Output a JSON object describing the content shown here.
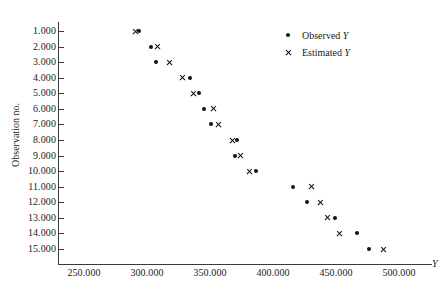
{
  "chart_data": {
    "type": "scatter",
    "title": "",
    "xlabel": "Y",
    "ylabel": "Observation no.",
    "xlim": [
      235,
      515
    ],
    "ylim": [
      0.3,
      15.7
    ],
    "grid": false,
    "x_ticks": [
      "250.000",
      "300.000",
      "350.000",
      "400.000",
      "450.000",
      "500.000"
    ],
    "x_tick_values": [
      250,
      300,
      350,
      400,
      450,
      500
    ],
    "y_ticks": [
      "1.000",
      "2.000",
      "3.000",
      "4.000",
      "5.000",
      "6.000",
      "7.000",
      "8.000",
      "9.000",
      "10.000",
      "11.000",
      "12.000",
      "13.000",
      "14.000",
      "15.000"
    ],
    "y_tick_values": [
      1,
      2,
      3,
      4,
      5,
      6,
      7,
      8,
      9,
      10,
      11,
      12,
      13,
      14,
      15
    ],
    "legend_position": "top-right",
    "series": [
      {
        "name": "Observed Y",
        "marker": "dot",
        "color": "#111111",
        "points": [
          {
            "observation": 1,
            "value": 294.0
          },
          {
            "observation": 2,
            "value": 303.5
          },
          {
            "observation": 3,
            "value": 307.5
          },
          {
            "observation": 4,
            "value": 334.0
          },
          {
            "observation": 5,
            "value": 341.5
          },
          {
            "observation": 6,
            "value": 345.5
          },
          {
            "observation": 7,
            "value": 351.0
          },
          {
            "observation": 8,
            "value": 371.5
          },
          {
            "observation": 9,
            "value": 369.5
          },
          {
            "observation": 10,
            "value": 386.5
          },
          {
            "observation": 11,
            "value": 415.5
          },
          {
            "observation": 12,
            "value": 427.0
          },
          {
            "observation": 13,
            "value": 449.0
          },
          {
            "observation": 14,
            "value": 467.0
          },
          {
            "observation": 15,
            "value": 476.5
          }
        ]
      },
      {
        "name": "Estimated Y",
        "marker": "cross",
        "color": "#111111",
        "points": [
          {
            "observation": 1,
            "value": 290.5
          },
          {
            "observation": 2,
            "value": 308.5
          },
          {
            "observation": 3,
            "value": 318.0
          },
          {
            "observation": 4,
            "value": 328.5
          },
          {
            "observation": 5,
            "value": 337.0
          },
          {
            "observation": 6,
            "value": 352.5
          },
          {
            "observation": 7,
            "value": 356.5
          },
          {
            "observation": 8,
            "value": 367.5
          },
          {
            "observation": 9,
            "value": 374.5
          },
          {
            "observation": 10,
            "value": 381.5
          },
          {
            "observation": 11,
            "value": 430.5
          },
          {
            "observation": 12,
            "value": 437.5
          },
          {
            "observation": 13,
            "value": 443.0
          },
          {
            "observation": 14,
            "value": 453.0
          },
          {
            "observation": 15,
            "value": 487.5
          }
        ]
      }
    ]
  },
  "legend": {
    "items": [
      {
        "label_prefix": "Observed ",
        "label_symbol": "Y",
        "marker": "dot"
      },
      {
        "label_prefix": "Estimated ",
        "label_symbol": "Y",
        "marker": "cross"
      }
    ]
  }
}
